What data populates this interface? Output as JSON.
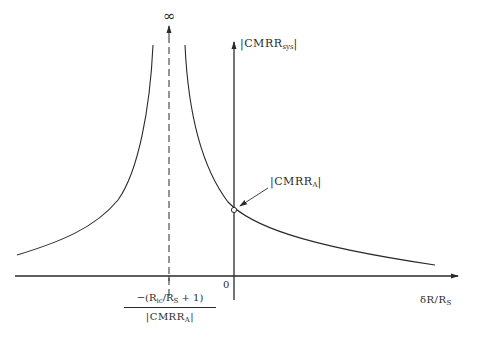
{
  "diagram": {
    "title": "",
    "labels": {
      "infinity": "∞",
      "y_axis": {
        "pre": "|CMRR",
        "sub": "sys",
        "post": "|"
      },
      "x_axis": {
        "pre": "δR/R",
        "sub": "S",
        "post": ""
      },
      "origin": "0",
      "point_label": {
        "pre": "|CMRR",
        "sub": "A",
        "post": "|"
      },
      "asymptote_numerator": {
        "p1": "−(R",
        "s1": "ic",
        "p2": "/R",
        "s2": "S",
        "p3": " + 1)"
      },
      "asymptote_denominator": {
        "pre": "|CMRR",
        "sub": "A",
        "post": "|"
      }
    },
    "elements": {
      "x_axis": {
        "x1": 15,
        "x2": 458,
        "y": 276
      },
      "y_axis": {
        "x": 234,
        "y1": 300,
        "y2": 42
      },
      "asymptote": {
        "x": 169,
        "y1": 296,
        "y2": 26,
        "style": "dashed"
      },
      "intercept_point": {
        "x": 234,
        "y": 210
      }
    },
    "colors": {
      "ink": "#2a2a2a",
      "background": "#ffffff"
    }
  }
}
